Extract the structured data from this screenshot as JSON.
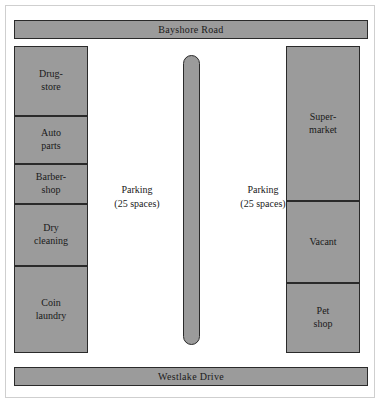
{
  "figure": {
    "colors": {
      "building_fill": "#9b9b9b",
      "outline": "#2a2a2a",
      "background": "#ffffff",
      "plate_border": "#cfcfcf"
    }
  },
  "roads": {
    "top": {
      "name": "Bayshore Road"
    },
    "bottom": {
      "name": "Westlake Drive"
    }
  },
  "left_strip": {
    "units": [
      {
        "line1": "Drug-",
        "line2": "store"
      },
      {
        "line1": "Auto",
        "line2": "parts"
      },
      {
        "line1": "Barber-",
        "line2": "shop"
      },
      {
        "line1": "Dry",
        "line2": "cleaning"
      },
      {
        "line1": "Coin",
        "line2": "laundry"
      }
    ]
  },
  "right_strip": {
    "units": [
      {
        "line1": "Super-",
        "line2": "market"
      },
      {
        "line1": "Vacant",
        "line2": ""
      },
      {
        "line1": "Pet",
        "line2": "shop"
      }
    ]
  },
  "parking": {
    "left": {
      "line1": "Parking",
      "line2": "(25 spaces)"
    },
    "right": {
      "line1": "Parking",
      "line2": "(25 spaces)"
    }
  },
  "median": {
    "label": "landscaped median island"
  }
}
